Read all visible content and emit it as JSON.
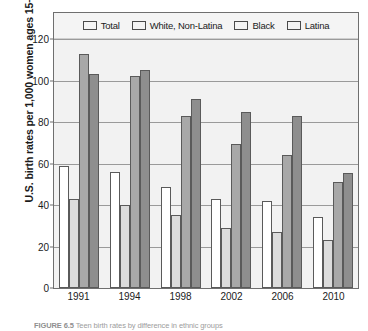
{
  "chart_data": {
    "type": "bar",
    "title": "",
    "xlabel": "",
    "ylabel": "U.S. birth rates per 1,000 women ages 15–19",
    "categories": [
      "1991",
      "1994",
      "1998",
      "2002",
      "2006",
      "2010"
    ],
    "series": [
      {
        "name": "Total",
        "color": "#ffffff",
        "values": [
          59,
          56,
          48.5,
          43,
          42,
          34
        ]
      },
      {
        "name": "White, Non-Latina",
        "color": "#dcdcdc",
        "values": [
          43,
          40,
          35,
          29,
          27,
          23
        ]
      },
      {
        "name": "Black",
        "color": "#a8a8a8",
        "values": [
          113,
          102,
          83,
          69.5,
          64,
          51
        ]
      },
      {
        "name": "Latina",
        "color": "#8e8e8e",
        "values": [
          103,
          105,
          91,
          85,
          83,
          55.5
        ]
      }
    ],
    "ylim": [
      0,
      120
    ],
    "yticks": [
      0,
      20,
      40,
      60,
      80,
      100,
      120
    ],
    "ytick_labels": [
      "0",
      "20",
      "40",
      "60",
      "80",
      "100",
      "120"
    ],
    "grid": true,
    "legend_position": "top-inside"
  },
  "caption": {
    "label": "FIGURE 6.5",
    "text": "Teen birth rates by difference in ethnic groups"
  }
}
